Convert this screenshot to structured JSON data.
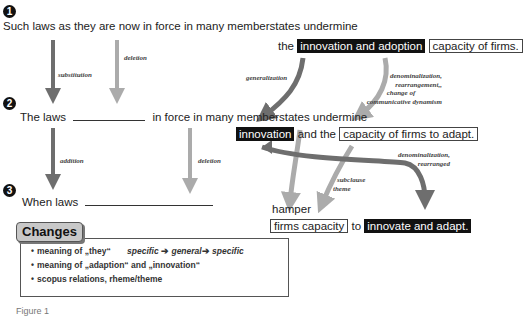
{
  "steps": [
    {
      "number": "1",
      "sentence_left": "Such laws as they are now in force in many memberstates undermine",
      "sentence_right": {
        "prefix": "the",
        "highlight_inverted": "innovation and adoption",
        "highlight_boxed": "capacity of firms."
      }
    },
    {
      "number": "2",
      "sentence_left_a": "The laws",
      "sentence_left_b": "in force in many memberstates undermine",
      "sentence_right": {
        "highlight_inverted": "innovation",
        "middle": "and the",
        "highlight_boxed": "capacity of firms to adapt."
      }
    },
    {
      "number": "3",
      "sentence_left": "When laws",
      "sentence_right": {
        "verb": "hamper",
        "highlight_boxed": "firms capacity",
        "middle": "to",
        "highlight_inverted": "innovate and adapt."
      }
    }
  ],
  "transformations": {
    "step1_to_2": {
      "left_arrow": "substitution",
      "middle_arrow": "deletion",
      "right_dark_arrow": "generalization",
      "right_light_arrow": [
        "denominalization,",
        "rearrangement,,",
        "change of",
        "communicative dynamism"
      ]
    },
    "step2_to_3": {
      "left_arrow": "addition",
      "middle_arrow": "deletion",
      "right_dark_arrow": [
        "denominalization,",
        "rearranged"
      ],
      "right_light_arrow": [
        "subclause",
        "theme"
      ]
    }
  },
  "changes": {
    "title": "Changes",
    "items": [
      {
        "bullet": "•",
        "text": "meaning of „they“",
        "detail": {
          "a": "specific",
          "arrow1": "➔",
          "b": "general",
          "arrow2": "➔",
          "c": "specific"
        }
      },
      {
        "bullet": "•",
        "text": "meaning of „adaption“ and „innovation“"
      },
      {
        "bullet": "•",
        "text": "scopus relations, rheme/theme"
      }
    ]
  },
  "caption": "Figure 1",
  "colors": {
    "dark_arrow": "#6e6e6e",
    "light_arrow": "#aaaaaa",
    "inverted_bg": "#111111",
    "tab_bg": "#c8c8c8"
  }
}
